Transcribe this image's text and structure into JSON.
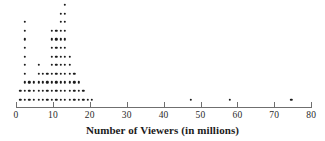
{
  "chart_data": {
    "type": "dotplot",
    "title": "",
    "xlabel": "Number of Viewers (in millions)",
    "ylabel": "",
    "xlim": [
      0,
      80
    ],
    "xticks": [
      0,
      10,
      20,
      30,
      40,
      50,
      60,
      70,
      80
    ],
    "xtick_labels": [
      "0",
      "10",
      "20",
      "30",
      "40",
      "50",
      "60",
      "70",
      "80"
    ],
    "grid": false,
    "legend": null,
    "dot_color": "#1b1b1b",
    "axis_color": "#6f6f6f",
    "stacks": [
      {
        "value": 1.2,
        "count": 2
      },
      {
        "value": 2.4,
        "count": 10
      },
      {
        "value": 3.6,
        "count": 3
      },
      {
        "value": 4.9,
        "count": 3
      },
      {
        "value": 6.1,
        "count": 5
      },
      {
        "value": 7.3,
        "count": 4
      },
      {
        "value": 8.5,
        "count": 4
      },
      {
        "value": 9.7,
        "count": 9
      },
      {
        "value": 10.9,
        "count": 9
      },
      {
        "value": 12.1,
        "count": 11
      },
      {
        "value": 13.3,
        "count": 12
      },
      {
        "value": 14.6,
        "count": 6
      },
      {
        "value": 15.8,
        "count": 4
      },
      {
        "value": 17.0,
        "count": 3
      },
      {
        "value": 18.2,
        "count": 2
      },
      {
        "value": 19.4,
        "count": 1
      },
      {
        "value": 20.6,
        "count": 1
      },
      {
        "value": 47.3,
        "count": 1
      },
      {
        "value": 58.0,
        "count": 1
      },
      {
        "value": 74.6,
        "count": 1
      }
    ],
    "total_dots": 92,
    "outliers": [
      47.3,
      58.0,
      74.6
    ]
  },
  "axis_title": {
    "text": "Number of Viewers (in millions)"
  }
}
